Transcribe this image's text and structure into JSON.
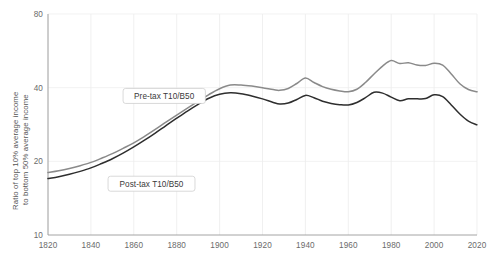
{
  "chart_data": {
    "type": "line",
    "title": "",
    "subtitle": "",
    "xlabel": "",
    "ylabel": "Ratio of top 10% average income to bottom 50% average income",
    "ylabel_line1": "Ratio of top 10% average income",
    "ylabel_line2": "to bottom 50% average income",
    "yscale": "log",
    "ylim": [
      10,
      80
    ],
    "xlim": [
      1820,
      2020
    ],
    "grid": true,
    "legend_position": "inline-annotations",
    "xticks": [
      1820,
      1840,
      1860,
      1880,
      1900,
      1920,
      1940,
      1960,
      1980,
      2000,
      2020
    ],
    "xtick_labels": [
      "1820",
      "1840",
      "1860",
      "1880",
      "1900",
      "1920",
      "1940",
      "1960",
      "1980",
      "2000",
      "2020"
    ],
    "yticks": [
      10,
      20,
      40,
      80
    ],
    "ytick_labels": [
      "10",
      "20",
      "40",
      "80"
    ],
    "colors": {
      "pre_tax": "#8a8a8a",
      "post_tax": "#2e2e2e",
      "gridline": "#ededed",
      "axis": "#9a9a9a",
      "background": "#ffffff",
      "tick_label": "#6b6b6b"
    },
    "annotations": [
      {
        "label": "Pre-tax T10/B50",
        "x": 1855,
        "y": 37
      },
      {
        "label": "Post-tax T10/B50",
        "x": 1848,
        "y": 16.2
      }
    ],
    "series": [
      {
        "name": "Pre-tax T10/B50",
        "color": "#8a8a8a",
        "x": [
          1820,
          1825,
          1830,
          1835,
          1840,
          1845,
          1850,
          1855,
          1860,
          1865,
          1870,
          1875,
          1880,
          1885,
          1890,
          1895,
          1900,
          1905,
          1910,
          1915,
          1920,
          1925,
          1928,
          1932,
          1936,
          1940,
          1944,
          1948,
          1952,
          1956,
          1960,
          1964,
          1968,
          1972,
          1976,
          1980,
          1984,
          1988,
          1992,
          1996,
          2000,
          2004,
          2008,
          2012,
          2016,
          2020
        ],
        "values": [
          18.0,
          18.3,
          18.7,
          19.2,
          19.8,
          20.6,
          21.5,
          22.6,
          23.8,
          25.3,
          27.0,
          28.9,
          30.9,
          33.0,
          35.2,
          37.5,
          39.6,
          41.0,
          41.0,
          40.6,
          40.0,
          39.3,
          39.0,
          39.7,
          41.6,
          43.8,
          42.0,
          40.4,
          39.4,
          38.8,
          38.5,
          39.4,
          42.0,
          45.5,
          49.0,
          51.6,
          50.2,
          50.6,
          49.5,
          49.3,
          50.3,
          49.5,
          45.5,
          41.5,
          39.3,
          38.5
        ]
      },
      {
        "name": "Post-tax T10/B50",
        "color": "#2e2e2e",
        "x": [
          1820,
          1825,
          1830,
          1835,
          1840,
          1845,
          1850,
          1855,
          1860,
          1865,
          1870,
          1875,
          1880,
          1885,
          1890,
          1895,
          1900,
          1905,
          1910,
          1915,
          1920,
          1925,
          1928,
          1932,
          1936,
          1940,
          1944,
          1948,
          1952,
          1956,
          1960,
          1964,
          1968,
          1972,
          1976,
          1980,
          1984,
          1988,
          1992,
          1996,
          2000,
          2004,
          2008,
          2012,
          2016,
          2020
        ],
        "values": [
          17.0,
          17.3,
          17.7,
          18.2,
          18.8,
          19.6,
          20.5,
          21.6,
          22.9,
          24.4,
          26.1,
          28.0,
          30.0,
          32.1,
          34.2,
          36.2,
          37.6,
          38.1,
          37.8,
          37.0,
          36.0,
          34.8,
          34.3,
          34.6,
          35.8,
          37.2,
          36.4,
          35.2,
          34.5,
          34.1,
          34.0,
          34.8,
          36.4,
          38.3,
          38.0,
          36.6,
          35.4,
          36.0,
          36.0,
          36.1,
          37.4,
          36.8,
          34.0,
          31.2,
          29.2,
          28.2
        ]
      }
    ]
  }
}
